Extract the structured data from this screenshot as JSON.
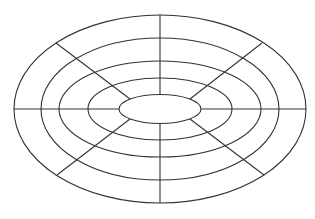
{
  "diagram": {
    "type": "concentric-ellipse-polar-grid",
    "center": {
      "cx": 160,
      "cy": 109
    },
    "stroke_color": "#333333",
    "background": "#ffffff",
    "rings": [
      {
        "rx": 146,
        "ry": 94
      },
      {
        "rx": 119,
        "ry": 71
      },
      {
        "rx": 101,
        "ry": 48
      },
      {
        "rx": 72,
        "ry": 31
      },
      {
        "rx": 41,
        "ry": 14.5
      }
    ],
    "spokes": [
      {
        "name": "top",
        "x1": 160,
        "y1": 15,
        "x2": 160,
        "y2": 94.5
      },
      {
        "name": "bottom",
        "x1": 160,
        "y1": 123.5,
        "x2": 160,
        "y2": 203
      },
      {
        "name": "left",
        "x1": 14,
        "y1": 109,
        "x2": 119,
        "y2": 109
      },
      {
        "name": "right",
        "x1": 201,
        "y1": 109,
        "x2": 306,
        "y2": 109
      },
      {
        "name": "upper-left",
        "x1": 56,
        "y1": 43,
        "x2": 130,
        "y2": 99
      },
      {
        "name": "upper-right",
        "x1": 262,
        "y1": 43,
        "x2": 190,
        "y2": 99
      },
      {
        "name": "lower-left",
        "x1": 57,
        "y1": 175,
        "x2": 130,
        "y2": 119
      },
      {
        "name": "lower-right",
        "x1": 264,
        "y1": 175,
        "x2": 190,
        "y2": 119
      }
    ],
    "caption": ""
  }
}
